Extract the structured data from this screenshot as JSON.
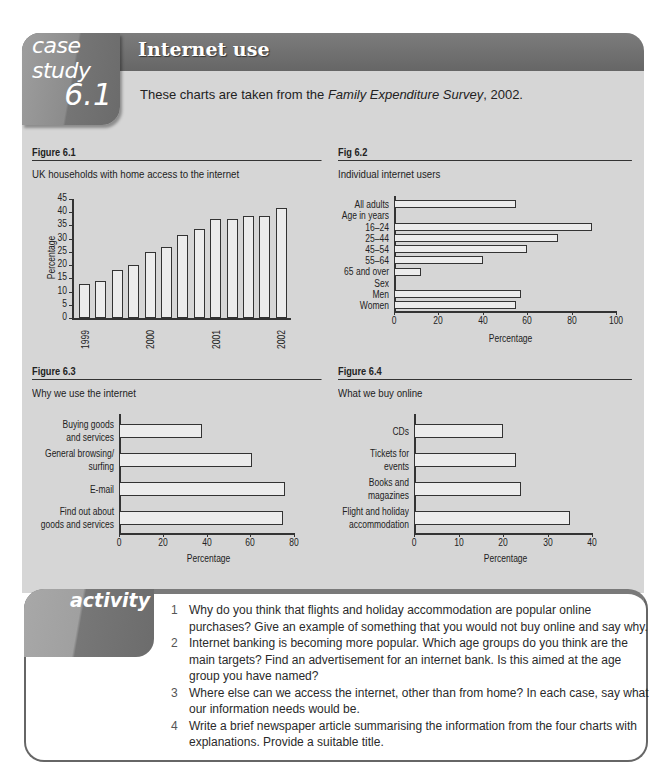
{
  "header": {
    "tab_label": "case study",
    "tab_number": "6.1",
    "title": "Internet use",
    "intro_before": "These charts are taken from the ",
    "intro_source": "Family Expenditure Survey",
    "intro_after": ", 2002."
  },
  "colors": {
    "frame_bg": "#d6d6d6",
    "titlebar": "#6f6f6f",
    "bar_fill": "#ececec",
    "bar_stroke": "#333333"
  },
  "figures": [
    {
      "number": "Figure 6.1",
      "title": "UK households with home access to the internet"
    },
    {
      "number": "Fig 6.2",
      "title": "Individual internet users"
    },
    {
      "number": "Figure 6.3",
      "title": "Why we use the internet"
    },
    {
      "number": "Figure 6.4",
      "title": "What we buy online"
    }
  ],
  "chart_data": [
    {
      "id": "fig6_1",
      "type": "bar",
      "title": "UK households with home access to the internet",
      "xlabel": "",
      "ylabel": "Percentage",
      "ylim": [
        0,
        45
      ],
      "yticks": [
        0,
        5,
        10,
        15,
        20,
        25,
        30,
        35,
        40,
        45
      ],
      "categories": [
        "1999",
        "",
        "",
        "",
        "2000",
        "",
        "",
        "",
        "2001",
        "",
        "",
        "",
        "2002"
      ],
      "x_tick_labels": [
        {
          "index": 0,
          "label": "1999"
        },
        {
          "index": 4,
          "label": "2000"
        },
        {
          "index": 8,
          "label": "2001"
        },
        {
          "index": 12,
          "label": "2002"
        }
      ],
      "values": [
        13,
        14,
        18,
        20,
        25,
        27,
        31.5,
        33.5,
        37.5,
        37.5,
        38.5,
        38.5,
        41.5
      ],
      "grid": false
    },
    {
      "id": "fig6_2",
      "type": "bar",
      "orientation": "horizontal",
      "title": "Individual internet users",
      "xlabel": "Percentage",
      "xlim": [
        0,
        100
      ],
      "xticks": [
        0,
        20,
        40,
        60,
        80,
        100
      ],
      "categories": [
        "All adults",
        "Age in years",
        "16–24",
        "25–44",
        "45–54",
        "55–64",
        "65 and over",
        "Sex",
        "Men",
        "Women"
      ],
      "values": [
        55,
        null,
        89,
        74,
        60,
        40,
        12,
        null,
        57,
        55
      ],
      "grid": false
    },
    {
      "id": "fig6_3",
      "type": "bar",
      "orientation": "horizontal",
      "title": "Why we use the internet",
      "xlabel": "Percentage",
      "xlim": [
        0,
        80
      ],
      "xticks": [
        0,
        20,
        40,
        60,
        80
      ],
      "categories": [
        "Buying goods and services",
        "General browsing/ surfing",
        "E-mail",
        "Find out about goods and services"
      ],
      "category_lines": [
        [
          "Buying goods",
          "and services"
        ],
        [
          "General browsing/",
          "surfing"
        ],
        [
          "E-mail"
        ],
        [
          "Find out about",
          "goods and services"
        ]
      ],
      "values": [
        38,
        61,
        76,
        75
      ],
      "grid": false
    },
    {
      "id": "fig6_4",
      "type": "bar",
      "orientation": "horizontal",
      "title": "What we buy online",
      "xlabel": "Percentage",
      "xlim": [
        0,
        40
      ],
      "xticks": [
        0,
        10,
        20,
        30,
        40
      ],
      "categories": [
        "CDs",
        "Tickets for events",
        "Books and magazines",
        "Flight and holiday accommodation"
      ],
      "category_lines": [
        [
          "CDs"
        ],
        [
          "Tickets for",
          "events"
        ],
        [
          "Books and",
          "magazines"
        ],
        [
          "Flight and holiday",
          "accommodation"
        ]
      ],
      "values": [
        20,
        23,
        24,
        35
      ],
      "grid": false
    }
  ],
  "activity": {
    "label": "activity",
    "questions": [
      {
        "n": "1",
        "text": "Why do you think that flights and holiday accommodation are popular online purchases? Give an example of something that you would not buy online and say why."
      },
      {
        "n": "2",
        "text": "Internet banking is becoming more popular. Which age groups do you think are the main targets? Find an advertisement for an internet bank. Is this aimed at the age group you have named?"
      },
      {
        "n": "3",
        "text": "Where else can we access the internet, other than from home? In each case, say what our information needs would be."
      },
      {
        "n": "4",
        "text": "Write a brief newspaper article summarising the information from the four charts with explanations. Provide a suitable title."
      }
    ]
  }
}
